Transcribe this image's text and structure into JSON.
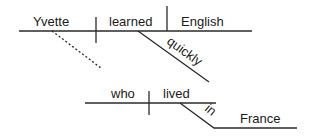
{
  "diagram": {
    "type": "sentence-diagram",
    "main_clause": {
      "subject": "Yvette",
      "verb": "learned",
      "object": "English",
      "modifier": "quickly"
    },
    "relative_clause": {
      "subject": "who",
      "verb": "lived",
      "preposition": "in",
      "prepositional_object": "France"
    }
  }
}
